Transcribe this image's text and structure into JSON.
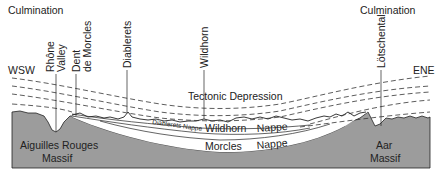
{
  "culminations": {
    "left": "Culmination",
    "right": "Culmination"
  },
  "directions": {
    "west": "WSW",
    "east": "ENE"
  },
  "peaks": [
    {
      "line1": "Rhône",
      "line2": "Valley"
    },
    {
      "line1": "Dent",
      "line2": "de Morcles"
    },
    {
      "line1": "Diablerets"
    },
    {
      "line1": "Wildhorn"
    },
    {
      "line1": "Lötschental"
    }
  ],
  "central_label": "Tectonic Depression",
  "nappes": {
    "diablerets": "Diablerets Nappe",
    "wildhorn_1": "Wildhorn",
    "wildhorn_2": "Nappe",
    "morcles_1": "Morcles",
    "morcles_2": "Nappe"
  },
  "massifs": {
    "left_1": "Aiguilles Rouges",
    "left_2": "Massif",
    "right_1": "Aar",
    "right_2": "Massif"
  },
  "colors": {
    "massif": "#9a9a9a",
    "line": "#222222",
    "background": "#ffffff"
  }
}
